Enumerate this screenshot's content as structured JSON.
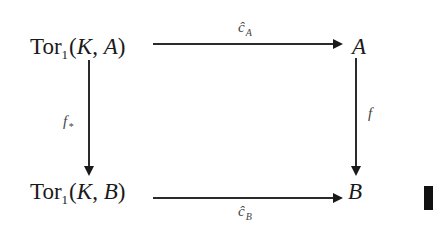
{
  "diagram": {
    "type": "commutative-square",
    "nodes": {
      "top_left": {
        "prefix": "Tor",
        "sub": "1",
        "open": "(",
        "arg1": "K",
        "comma": ", ",
        "arg2": "A",
        "close": ")"
      },
      "top_right": {
        "text": "A"
      },
      "bottom_left": {
        "prefix": "Tor",
        "sub": "1",
        "open": "(",
        "arg1": "K",
        "comma": ", ",
        "arg2": "B",
        "close": ")"
      },
      "bottom_right": {
        "text": "B"
      }
    },
    "arrows": {
      "top": {
        "from": "top_left",
        "to": "top_right",
        "label": "ĉ",
        "label_sub": "A"
      },
      "bottom": {
        "from": "bottom_left",
        "to": "bottom_right",
        "label": "ĉ",
        "label_sub": "B"
      },
      "left": {
        "from": "top_left",
        "to": "bottom_left",
        "label": "f",
        "label_sub": "*"
      },
      "right": {
        "from": "top_right",
        "to": "bottom_right",
        "label": "f"
      }
    },
    "end_mark": "tombstone"
  }
}
